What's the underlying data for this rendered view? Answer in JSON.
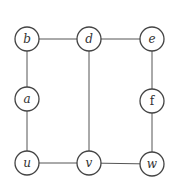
{
  "graph": {
    "nodes": [
      {
        "id": "b",
        "label": "b",
        "x": 27,
        "y": 39
      },
      {
        "id": "d",
        "label": "d",
        "x": 89,
        "y": 39
      },
      {
        "id": "e",
        "label": "e",
        "x": 152,
        "y": 39
      },
      {
        "id": "a",
        "label": "a",
        "x": 27,
        "y": 99
      },
      {
        "id": "f",
        "label": "f",
        "x": 152,
        "y": 101
      },
      {
        "id": "u",
        "label": "u",
        "x": 27,
        "y": 163
      },
      {
        "id": "v",
        "label": "v",
        "x": 89,
        "y": 163
      },
      {
        "id": "w",
        "label": "w",
        "x": 152,
        "y": 164
      }
    ],
    "edges": [
      [
        "b",
        "d"
      ],
      [
        "d",
        "e"
      ],
      [
        "b",
        "a"
      ],
      [
        "a",
        "u"
      ],
      [
        "u",
        "v"
      ],
      [
        "v",
        "w"
      ],
      [
        "d",
        "v"
      ],
      [
        "e",
        "f"
      ],
      [
        "f",
        "w"
      ]
    ],
    "node_radius": 12
  }
}
